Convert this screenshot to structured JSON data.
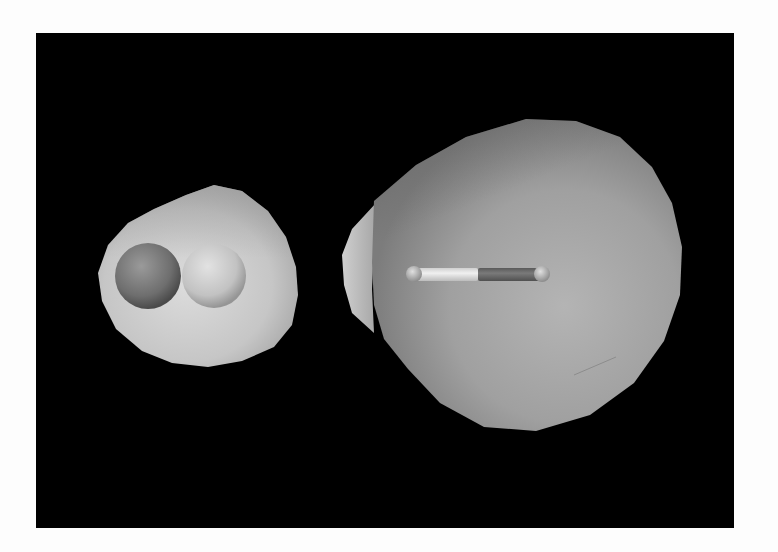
{
  "figure": {
    "background_color": "#000000",
    "page_color": "#fdfdfd",
    "objects": [
      {
        "name": "small-isosurface",
        "description": "diatomic molecule with two spheres enclosed in a light gray surface",
        "surface_color": "#c9c9c9",
        "atoms": [
          {
            "name": "left-atom",
            "color": "#7a7a7a"
          },
          {
            "name": "right-atom",
            "color": "#c4c4c4"
          }
        ]
      },
      {
        "name": "large-isosurface",
        "description": "large teardrop-shaped gray surface enclosing a linear rod molecule",
        "surface_color": "#9a9a9a",
        "rod": {
          "left_segment_color": "#e4e4e4",
          "right_segment_color": "#6a6a6a",
          "end_cap_color": "#b8b8b8"
        }
      }
    ]
  }
}
